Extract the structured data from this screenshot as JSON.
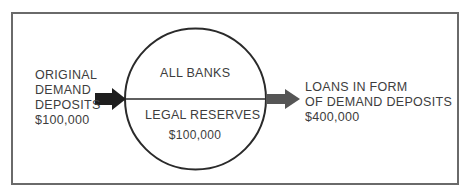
{
  "diagram": {
    "circle": {
      "top_label": "ALL BANKS",
      "bottom_label": "LEGAL RESERVES",
      "bottom_amount": "$100,000"
    },
    "input": {
      "lines": [
        "ORIGINAL",
        "DEMAND",
        "DEPOSITS",
        "$100,000"
      ]
    },
    "output": {
      "lines": [
        "LOANS IN FORM",
        "OF DEMAND DEPOSITS",
        "$400,000"
      ]
    },
    "colors": {
      "frame": "#6a6a6a",
      "circle": "#2a2a2a",
      "input_arrow": "#1e1e1e",
      "output_arrow": "#555555",
      "text": "#3d3d3d"
    }
  }
}
